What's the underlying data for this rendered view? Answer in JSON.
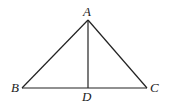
{
  "diagram": {
    "type": "geometry-figure",
    "points": {
      "A": {
        "label": "A",
        "x": 88,
        "y": 20
      },
      "B": {
        "label": "B",
        "x": 22,
        "y": 88
      },
      "C": {
        "label": "C",
        "x": 147,
        "y": 88
      },
      "D": {
        "label": "D",
        "x": 88,
        "y": 88
      }
    },
    "segments": [
      [
        "A",
        "B"
      ],
      [
        "A",
        "C"
      ],
      [
        "B",
        "C"
      ],
      [
        "A",
        "D"
      ]
    ],
    "labels": {
      "A": "A",
      "B": "B",
      "C": "C",
      "D": "D"
    },
    "stroke_color": "#222222",
    "background": "#ffffff"
  }
}
